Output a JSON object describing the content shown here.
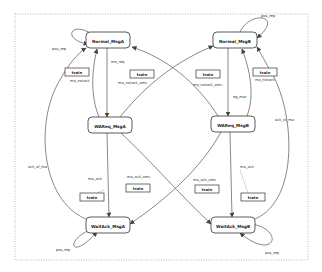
{
  "diagram": {
    "type": "state-machine",
    "border": {
      "x": 15,
      "y": 14,
      "w": 293,
      "h": 246,
      "style": "dotted"
    },
    "states": [
      {
        "id": "normal_a",
        "label": "Normal_MsgA",
        "x": 86,
        "y": 32,
        "w": 44,
        "h": 16
      },
      {
        "id": "normal_b",
        "label": "Normal_MsgB",
        "x": 213,
        "y": 32,
        "w": 44,
        "h": 16
      },
      {
        "id": "wareq_a",
        "label": "WAReq_MsgA",
        "x": 88,
        "y": 117,
        "w": 44,
        "h": 16
      },
      {
        "id": "wareq_b",
        "label": "WAReq_MsgB",
        "x": 211,
        "y": 116,
        "w": 44,
        "h": 16
      },
      {
        "id": "waitack_a",
        "label": "WaitAck_MsgA",
        "x": 86,
        "y": 217,
        "w": 44,
        "h": 16
      },
      {
        "id": "waitack_b",
        "label": "WaitAck_MsgB",
        "x": 211,
        "y": 217,
        "w": 44,
        "h": 16
      }
    ],
    "actions": [
      {
        "id": "train1",
        "label": "train",
        "x": 65,
        "y": 68,
        "w": 24,
        "h": 8,
        "note": "ma_notack"
      },
      {
        "id": "train2",
        "label": "train",
        "x": 130,
        "y": 70,
        "w": 24,
        "h": 8,
        "note": "ma_notack_omc"
      },
      {
        "id": "train3",
        "label": "train",
        "x": 196,
        "y": 70,
        "w": 24,
        "h": 8,
        "note": "ma_notack_omc"
      },
      {
        "id": "train4",
        "label": "train",
        "x": 253,
        "y": 68,
        "w": 24,
        "h": 8,
        "note": "ma_notack"
      },
      {
        "id": "train5",
        "label": "train",
        "x": 80,
        "y": 193,
        "w": 24,
        "h": 8,
        "note": "ma_ack"
      },
      {
        "id": "train6",
        "label": "train",
        "x": 126,
        "y": 184,
        "w": 24,
        "h": 8,
        "note": "ma_ack_omc"
      },
      {
        "id": "train7",
        "label": "train",
        "x": 195,
        "y": 185,
        "w": 24,
        "h": 8,
        "note": "ma_ack_omc"
      },
      {
        "id": "train8",
        "label": "train",
        "x": 241,
        "y": 193,
        "w": 24,
        "h": 8,
        "note": "ma_ack"
      }
    ],
    "edge_labels": [
      {
        "text": "pos_rep",
        "x": 52,
        "y": 50
      },
      {
        "text": "pos_rep",
        "x": 261,
        "y": 17
      },
      {
        "text": "pos_rep",
        "x": 56,
        "y": 251
      },
      {
        "text": "pos_rep",
        "x": 265,
        "y": 254
      },
      {
        "text": "ma_req",
        "x": 111,
        "y": 63
      },
      {
        "text": "eg_mar",
        "x": 233,
        "y": 98
      },
      {
        "text": "ma_notack",
        "x": 70,
        "y": 82
      },
      {
        "text": "ma_notack_omc",
        "x": 118,
        "y": 84
      },
      {
        "text": "ma_notack_omc",
        "x": 193,
        "y": 86
      },
      {
        "text": "ma_notack",
        "x": 255,
        "y": 81
      },
      {
        "text": "ack_of_ma",
        "x": 28,
        "y": 168
      },
      {
        "text": "ack_of_ma",
        "x": 275,
        "y": 121
      },
      {
        "text": "ma_ack",
        "x": 88,
        "y": 180
      },
      {
        "text": "ma_ack_omc",
        "x": 127,
        "y": 178
      },
      {
        "text": "ma_ack_omc",
        "x": 193,
        "y": 181
      },
      {
        "text": "ma_ack",
        "x": 240,
        "y": 168
      }
    ],
    "colors": {
      "line": "#555555",
      "box_border": "#333333",
      "text": "#222222",
      "border_dots": "#999999",
      "background": "#ffffff"
    }
  }
}
